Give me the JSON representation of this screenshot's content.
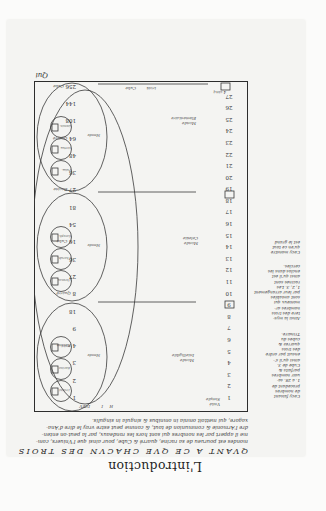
{
  "page": {
    "orientation": "rotated-180",
    "title": "L'introduction",
    "heading": "QVANT A CE QVE CHACVN DES TROIS",
    "paragraph_lines": [
      "mondes est pourueu de sa racine, quarré & Cube, pour ainsi que l'Vniuers, com-",
      "me il appert par les nombres qui sont hors les rondeaux, par la peut-on enten-",
      "dre l'Armonie & communion de tout, & comme peut estre vray le dire d'Ana-",
      "xagore, qui mettoit omnia in omnibus & singula in singulis."
    ],
    "catchword": "Qui"
  },
  "table": {
    "top_right_label": "4 cinq",
    "top_labels": [
      "Cube",
      "trois"
    ],
    "bottom_labels": [
      "H",
      "I",
      "DIEV"
    ],
    "bottom_left_label": "Vnité Simple",
    "right_column_numbers": [
      "1",
      "2",
      "3",
      "4",
      "5",
      "6",
      "7",
      "8",
      "9",
      "10",
      "11",
      "12",
      "13",
      "14",
      "15",
      "16",
      "17",
      "18",
      "19",
      "20",
      "21",
      "22",
      "23",
      "24",
      "25",
      "26",
      "27"
    ],
    "left_column": [
      {
        "value": "1",
        "label": ""
      },
      {
        "value": "2",
        "label": ""
      },
      {
        "value": "3",
        "label": ""
      },
      {
        "value": "4",
        "label": "Racine"
      },
      {
        "value": "9",
        "label": ""
      },
      {
        "value": "18",
        "label": ""
      },
      {
        "value": "8",
        "label": "Quarré"
      },
      {
        "value": "27",
        "label": ""
      },
      {
        "value": "36",
        "label": ""
      },
      {
        "value": "16",
        "label": "Cube"
      },
      {
        "value": "54",
        "label": ""
      },
      {
        "value": "81",
        "label": ""
      },
      {
        "value": "27",
        "label": "Racine"
      },
      {
        "value": "36",
        "label": ""
      },
      {
        "value": "48",
        "label": ""
      },
      {
        "value": "64",
        "label": "Quarré"
      },
      {
        "value": "108",
        "label": ""
      },
      {
        "value": "144",
        "label": ""
      },
      {
        "value": "256",
        "label": "Cube"
      }
    ],
    "region_labels": [
      "Monde Angelique",
      "Monde Celeste",
      "Monde Elementaire",
      "Monde Intelligible"
    ],
    "inner_circle_labels": [
      [
        "Vnité",
        "Racine",
        "Trinité"
      ],
      [
        "Seraphins",
        "Cherubins",
        "Thrones"
      ],
      [
        "Dominations",
        "Vertus",
        "Puissances"
      ],
      [
        "Principautez",
        "Archanges",
        "Anges"
      ],
      [
        "Saturne",
        "Iupiter",
        "Mars"
      ],
      [
        "Soleil",
        "Venus",
        "Mercure"
      ],
      [
        "Lune",
        "Feu",
        "Air"
      ],
      [
        "Eau",
        "Terre",
        "Homme"
      ],
      [
        "Genre",
        "Espece",
        "Indiuidu"
      ]
    ]
  },
  "margin_notes": {
    "upper": [
      "Cecy monstre",
      "qu'en ce tout",
      "est le grand"
    ],
    "lower": [
      "Ainsi la mys-",
      "tere des trois",
      "nombres ar-",
      "monieux qui",
      "sont amiables",
      "par leur arrangement",
      "1, 2, 3. Les",
      "racines sont",
      "ainsi qu'il est",
      "enclos dans les",
      "cercles."
    ],
    "lowest": [
      "Cecy faisant",
      "de nombres",
      "procedant de",
      "1. a 28. sa-",
      "uoir nombres",
      "parfaits &",
      "Cube de 3.",
      "ainsi qu'il s'-",
      "ensuit par ordre",
      "des trois",
      "quarrez &",
      "cubes du",
      "Trinaire."
    ]
  }
}
